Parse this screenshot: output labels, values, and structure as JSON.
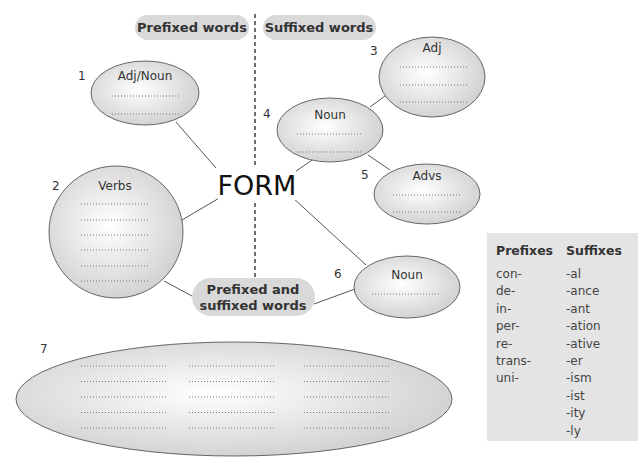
{
  "headers": {
    "prefixed": "Prefixed words",
    "suffixed": "Suffixed words",
    "both_line1": "Prefixed and",
    "both_line2": "suffixed words"
  },
  "center_word": "FORM",
  "nodes": [
    {
      "number": "1",
      "label": "Adj/Noun",
      "blanks": 2,
      "side": "prefixed"
    },
    {
      "number": "2",
      "label": "Verbs",
      "blanks": 6,
      "side": "prefixed"
    },
    {
      "number": "3",
      "label": "Adj",
      "blanks": 3,
      "side": "suffixed"
    },
    {
      "number": "4",
      "label": "Noun",
      "blanks": 2,
      "side": "suffixed"
    },
    {
      "number": "5",
      "label": "Advs",
      "blanks": 2,
      "side": "suffixed"
    },
    {
      "number": "6",
      "label": "Noun",
      "blanks": 1,
      "side": "prefixed-and-suffixed"
    },
    {
      "number": "7",
      "label": "",
      "blanks": 15,
      "blank_columns": 3,
      "side": "prefixed-and-suffixed"
    }
  ],
  "affix_table": {
    "prefixes_header": "Prefixes",
    "suffixes_header": "Suffixes",
    "prefixes": [
      "con-",
      "de-",
      "in-",
      "per-",
      "re-",
      "trans-",
      "uni-"
    ],
    "suffixes": [
      "-al",
      "-ance",
      "-ant",
      "-ation",
      "-ative",
      "-er",
      "-ism",
      "-ist",
      "-ity",
      "-ly"
    ]
  },
  "colors": {
    "pill_fill": "#d9d9d9",
    "node_fill_center": "#ffffff",
    "node_fill_edge": "#cfcfcf",
    "box_fill": "#e4e4e4"
  }
}
